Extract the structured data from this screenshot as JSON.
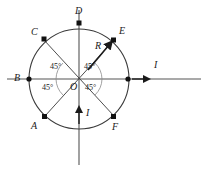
{
  "figure": {
    "title": "",
    "caption": "",
    "background_color": "#ffffff",
    "stroke_color": "#3a3a3a",
    "label_color": "#1a1a1a"
  },
  "circle": {
    "center_label": "O",
    "center_x": 79,
    "center_y": 79,
    "radius": 50
  },
  "points": [
    {
      "label": "A",
      "angle_deg": 225,
      "x": 45,
      "y": 117,
      "label_x": 31,
      "label_y": 121
    },
    {
      "label": "B",
      "angle_deg": 180,
      "x": 29,
      "y": 79,
      "label_x": 14,
      "label_y": 74
    },
    {
      "label": "C",
      "angle_deg": 135,
      "x": 44,
      "y": 39,
      "label_x": 31,
      "label_y": 28
    },
    {
      "label": "D",
      "angle_deg": 90,
      "x": 79,
      "y": 23,
      "label_x": 75,
      "label_y": 8
    },
    {
      "label": "E",
      "angle_deg": 45,
      "x": 114,
      "y": 40,
      "label_x": 118,
      "label_y": 27
    },
    {
      "label": "F",
      "angle_deg": 315,
      "x": 114,
      "y": 117,
      "label_x": 112,
      "label_y": 122
    }
  ],
  "right_marker": {
    "x": 128,
    "y": 79
  },
  "angles": [
    {
      "value": "45°",
      "x": 50,
      "y": 66,
      "position": "upper-left"
    },
    {
      "value": "45°",
      "x": 84,
      "y": 66,
      "position": "upper-right"
    },
    {
      "value": "45°",
      "x": 44,
      "y": 85,
      "position": "lower-left"
    },
    {
      "value": "45°",
      "x": 85,
      "y": 85,
      "position": "lower-right"
    }
  ],
  "radius_label": {
    "text": "R",
    "x": 96,
    "y": 46
  },
  "current_labels": [
    {
      "text": "I",
      "x": 154,
      "y": 63,
      "direction": "right",
      "arrow_x": 137,
      "arrow_y": 79
    },
    {
      "text": "I",
      "x": 86,
      "y": 110,
      "direction": "up",
      "arrow_x": 79,
      "arrow_y": 114
    }
  ],
  "axes": {
    "horizontal": {
      "x1": 7,
      "y1": 79,
      "x2": 201,
      "y2": 79
    },
    "vertical": {
      "x1": 79,
      "y1": 10,
      "x2": 79,
      "y2": 165
    }
  },
  "diagonals": [
    {
      "from": "A",
      "to": "E"
    },
    {
      "from": "C",
      "to": "F"
    }
  ]
}
